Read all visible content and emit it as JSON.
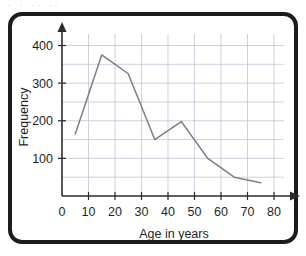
{
  "artifact": {
    "top_text": "·   ·  ··  ··"
  },
  "chart_data": {
    "type": "line",
    "title": "",
    "xlabel": "Age in years",
    "ylabel": "Frequency",
    "xlim": [
      0,
      80
    ],
    "ylim": [
      0,
      420
    ],
    "grid": true,
    "legend": false,
    "x_ticks": [
      0,
      10,
      20,
      30,
      40,
      50,
      60,
      70,
      80
    ],
    "x_tick_labels": [
      "0",
      "10",
      "20",
      "30",
      "40",
      "50",
      "60",
      "70",
      "80"
    ],
    "y_ticks": [
      100,
      200,
      300,
      400
    ],
    "y_tick_labels": [
      "100",
      "200",
      "300",
      "400"
    ],
    "x_gridlines": [
      10,
      20,
      30,
      40,
      50,
      60,
      70,
      80
    ],
    "y_gridlines": [
      50,
      100,
      150,
      200,
      250,
      300,
      350,
      400
    ],
    "series": [
      {
        "name": "Frequency",
        "color": "#7e7e84",
        "x": [
          5,
          15,
          25,
          35,
          45,
          55,
          65,
          75
        ],
        "values": [
          165,
          375,
          325,
          150,
          198,
          100,
          50,
          35
        ]
      }
    ]
  }
}
